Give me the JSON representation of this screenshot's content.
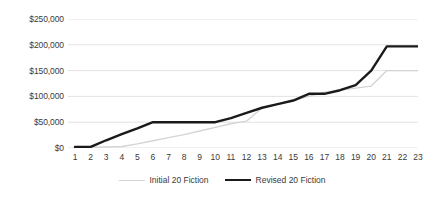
{
  "chart_data": {
    "type": "line",
    "title": "",
    "xlabel": "",
    "ylabel": "",
    "x": [
      1,
      2,
      3,
      4,
      5,
      6,
      7,
      8,
      9,
      10,
      11,
      12,
      13,
      14,
      15,
      16,
      17,
      18,
      19,
      20,
      21,
      22,
      23
    ],
    "xtick_labels": [
      "1",
      "2",
      "3",
      "4",
      "5",
      "6",
      "7",
      "8",
      "9",
      "10",
      "11",
      "12",
      "13",
      "14",
      "15",
      "16",
      "17",
      "18",
      "19",
      "20",
      "21",
      "22",
      "23"
    ],
    "ytick_labels": [
      "$0",
      "$50,000",
      "$100,000",
      "$150,000",
      "$200,000",
      "$250,000"
    ],
    "ytick_values": [
      0,
      50000,
      100000,
      150000,
      200000,
      250000
    ],
    "ylim": [
      0,
      250000
    ],
    "xlim": [
      1,
      23
    ],
    "grid": "horizontal",
    "legend_position": "bottom",
    "series": [
      {
        "name": "Initial 20 Fiction",
        "color": "#d4d4d4",
        "values": [
          1000,
          1500,
          2000,
          3000,
          8000,
          14000,
          20000,
          26000,
          33000,
          40000,
          47000,
          52000,
          78000,
          85000,
          92000,
          100000,
          108000,
          112000,
          116000,
          120000,
          150000,
          150000,
          150000
        ]
      },
      {
        "name": "Revised 20 Fiction",
        "color": "#1a1a1a",
        "values": [
          2000,
          2000,
          15000,
          27000,
          38000,
          50000,
          50000,
          50000,
          50000,
          50000,
          58000,
          68000,
          78000,
          85000,
          92000,
          105000,
          105000,
          112000,
          122000,
          150000,
          197000,
          197000,
          197000
        ]
      }
    ]
  },
  "legend": {
    "items": [
      {
        "label": "Initial 20 Fiction"
      },
      {
        "label": "Revised 20 Fiction"
      }
    ]
  },
  "colors": {
    "initial_series": "#d4d4d4",
    "revised_series": "#1a1a1a",
    "gridline": "#e3e3e3",
    "axis_text": "#3a3a3a",
    "background": "#ffffff"
  }
}
